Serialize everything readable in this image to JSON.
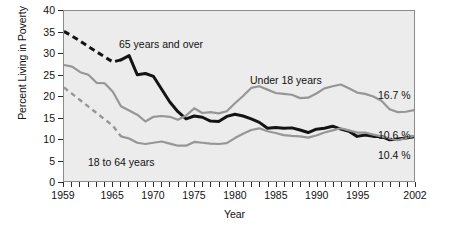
{
  "chart_data": {
    "type": "line",
    "title": "",
    "xlabel": "Year",
    "ylabel": "Percent Living in Poverty",
    "xlim": [
      1959,
      2002
    ],
    "ylim": [
      0,
      40
    ],
    "ytick_labels": [
      "0",
      "5",
      "10",
      "15",
      "20",
      "25",
      "30",
      "35",
      "40"
    ],
    "ytick_values": [
      0,
      5,
      10,
      15,
      20,
      25,
      30,
      35,
      40
    ],
    "xtick_labels": [
      "1959",
      "1965",
      "1970",
      "1975",
      "1980",
      "1985",
      "1990",
      "1995",
      "2002"
    ],
    "xtick_values": [
      1959,
      1965,
      1970,
      1975,
      1980,
      1985,
      1990,
      1995,
      2002
    ],
    "grid": false,
    "legend_position": "inline-annotations",
    "colors": {
      "65_and_over": "#141414",
      "under_18": "#969696",
      "18_to_64": "#969696",
      "plot_background": "#ececec",
      "plot_border": "#8c8c8c",
      "page_background": "#ffffff",
      "text": "#111111"
    },
    "series": [
      {
        "name": "65 years and over",
        "color": "#141414",
        "label_text": "65 years and over",
        "end_value_label": "10.4 %",
        "dashed_until": 1966,
        "x": [
          1959,
          1960,
          1961,
          1962,
          1963,
          1964,
          1965,
          1966,
          1967,
          1968,
          1969,
          1970,
          1971,
          1972,
          1973,
          1974,
          1975,
          1976,
          1977,
          1978,
          1979,
          1980,
          1981,
          1982,
          1983,
          1984,
          1985,
          1986,
          1987,
          1988,
          1989,
          1990,
          1991,
          1992,
          1993,
          1994,
          1995,
          1996,
          1997,
          1998,
          1999,
          2000,
          2001,
          2002
        ],
        "y": [
          35.2,
          34.1,
          32.9,
          31.6,
          30.4,
          29.2,
          28.0,
          28.5,
          29.5,
          25.0,
          25.3,
          24.6,
          21.6,
          18.6,
          16.3,
          14.6,
          15.3,
          15.0,
          14.1,
          14.0,
          15.2,
          15.7,
          15.3,
          14.6,
          13.8,
          12.4,
          12.6,
          12.4,
          12.5,
          12.0,
          11.4,
          12.2,
          12.4,
          12.9,
          12.2,
          11.7,
          10.5,
          10.8,
          10.5,
          10.5,
          9.7,
          9.9,
          10.1,
          10.4
        ]
      },
      {
        "name": "Under 18 years",
        "color": "#969696",
        "label_text": "Under 18 years",
        "end_value_label": "16.7 %",
        "dashed_until": null,
        "x": [
          1959,
          1960,
          1961,
          1962,
          1963,
          1964,
          1965,
          1966,
          1967,
          1968,
          1969,
          1970,
          1971,
          1972,
          1973,
          1974,
          1975,
          1976,
          1977,
          1978,
          1979,
          1980,
          1981,
          1982,
          1983,
          1984,
          1985,
          1986,
          1987,
          1988,
          1989,
          1990,
          1991,
          1992,
          1993,
          1994,
          1995,
          1996,
          1997,
          1998,
          1999,
          2000,
          2001,
          2002
        ],
        "y": [
          27.3,
          26.9,
          25.6,
          25.0,
          23.1,
          23.0,
          21.0,
          17.6,
          16.6,
          15.6,
          14.0,
          15.1,
          15.3,
          15.1,
          14.4,
          15.4,
          17.1,
          16.0,
          16.2,
          15.9,
          16.4,
          18.3,
          20.0,
          21.9,
          22.3,
          21.5,
          20.7,
          20.5,
          20.3,
          19.5,
          19.6,
          20.6,
          21.8,
          22.3,
          22.7,
          21.8,
          20.8,
          20.5,
          19.9,
          18.9,
          16.9,
          16.2,
          16.3,
          16.7
        ]
      },
      {
        "name": "18 to 64 years",
        "color": "#969696",
        "label_text": "18 to 64 years",
        "end_value_label": "10.6 %",
        "dashed_until": 1966,
        "x": [
          1959,
          1960,
          1961,
          1962,
          1963,
          1964,
          1965,
          1966,
          1967,
          1968,
          1969,
          1970,
          1971,
          1972,
          1973,
          1974,
          1975,
          1976,
          1977,
          1978,
          1979,
          1980,
          1981,
          1982,
          1983,
          1984,
          1985,
          1986,
          1987,
          1988,
          1989,
          1990,
          1991,
          1992,
          1993,
          1994,
          1995,
          1996,
          1997,
          1998,
          1999,
          2000,
          2001,
          2002
        ],
        "y": [
          22.0,
          20.5,
          19.0,
          17.5,
          16.0,
          14.5,
          13.0,
          10.5,
          10.0,
          9.0,
          8.7,
          9.0,
          9.3,
          8.8,
          8.3,
          8.3,
          9.2,
          9.0,
          8.8,
          8.7,
          8.9,
          10.1,
          11.1,
          12.0,
          12.4,
          11.7,
          11.3,
          10.8,
          10.6,
          10.5,
          10.2,
          10.7,
          11.4,
          11.9,
          12.4,
          11.9,
          11.4,
          11.4,
          10.9,
          10.5,
          10.0,
          9.6,
          10.1,
          10.6
        ]
      }
    ],
    "annotations": [
      {
        "id": "label-65-over",
        "text": "65 years and over",
        "x_px": 119,
        "y_px": 39
      },
      {
        "id": "label-under-18",
        "text": "Under 18 years",
        "x_px": 250,
        "y_px": 75
      },
      {
        "id": "label-18-64",
        "text": "18 to 64 years",
        "x_px": 88,
        "y_px": 157
      },
      {
        "id": "value-16-7",
        "text": "16.7 %",
        "x_px": 378,
        "y_px": 90
      },
      {
        "id": "value-10-6",
        "text": "10.6 %",
        "x_px": 378,
        "y_px": 130
      },
      {
        "id": "value-10-4",
        "text": "10.4 %",
        "x_px": 378,
        "y_px": 150
      }
    ]
  }
}
